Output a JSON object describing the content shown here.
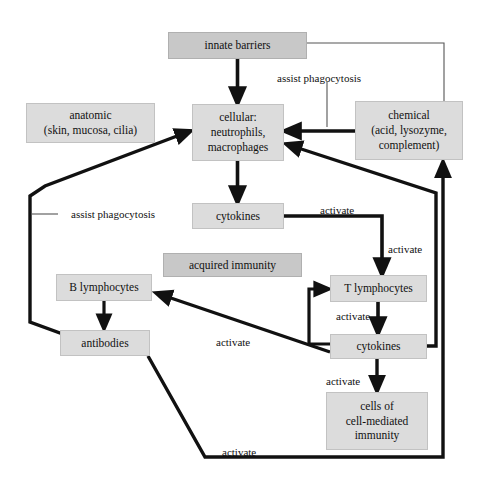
{
  "diagram": {
    "canvas": {
      "width": 478,
      "height": 488
    },
    "colors": {
      "node_fill": "#dcdcdc",
      "node_fill_dark": "#c8c8c8",
      "node_border": "#c2c2c2",
      "edge_stroke": "#111111",
      "background": "#ffffff"
    },
    "nodes": [
      {
        "id": "innate-barriers",
        "label": "innate barriers",
        "x": 168,
        "y": 32,
        "w": 139,
        "h": 27,
        "shade": "dark"
      },
      {
        "id": "anatomic",
        "label": "anatomic\n(skin, mucosa, cilia)",
        "x": 26,
        "y": 103,
        "w": 129,
        "h": 40,
        "shade": "light"
      },
      {
        "id": "cellular",
        "label": "cellular:\nneutrophils,\nmacrophages",
        "x": 192,
        "y": 104,
        "w": 92,
        "h": 57,
        "shade": "light"
      },
      {
        "id": "chemical",
        "label": "chemical\n(acid, lysozyme,\ncomplement)",
        "x": 355,
        "y": 101,
        "w": 108,
        "h": 59,
        "shade": "light"
      },
      {
        "id": "cytokines-innate",
        "label": "cytokines",
        "x": 192,
        "y": 203,
        "w": 92,
        "h": 26,
        "shade": "light"
      },
      {
        "id": "acquired-immunity",
        "label": "acquired immunity",
        "x": 163,
        "y": 253,
        "w": 139,
        "h": 24,
        "shade": "dark"
      },
      {
        "id": "b-lymphocytes",
        "label": "B lymphocytes",
        "x": 56,
        "y": 274,
        "w": 96,
        "h": 27,
        "shade": "light"
      },
      {
        "id": "t-lymphocytes",
        "label": "T lymphocytes",
        "x": 330,
        "y": 275,
        "w": 97,
        "h": 27,
        "shade": "light"
      },
      {
        "id": "antibodies",
        "label": "antibodies",
        "x": 60,
        "y": 330,
        "w": 90,
        "h": 26,
        "shade": "light"
      },
      {
        "id": "cytokines-acquired",
        "label": "cytokines",
        "x": 330,
        "y": 334,
        "w": 97,
        "h": 25,
        "shade": "light"
      },
      {
        "id": "cell-mediated",
        "label": "cells of\ncell-mediated\nimmunity",
        "x": 326,
        "y": 392,
        "w": 102,
        "h": 58,
        "shade": "light"
      }
    ],
    "edge_labels": [
      {
        "id": "assist-phagocytosis-top",
        "text": "assist phagocytosis",
        "x": 277,
        "y": 72
      },
      {
        "id": "assist-phagocytosis-left",
        "text": "assist phagocytosis",
        "x": 71,
        "y": 208
      },
      {
        "id": "activate-cytokines-to-t",
        "text": "activate",
        "x": 320,
        "y": 204
      },
      {
        "id": "activate-down-to-t",
        "text": "activate",
        "x": 388,
        "y": 243
      },
      {
        "id": "activate-t-feedback",
        "text": "activate",
        "x": 336,
        "y": 310
      },
      {
        "id": "activate-to-b",
        "text": "activate",
        "x": 216,
        "y": 336
      },
      {
        "id": "activate-to-cell-mediated",
        "text": "activate",
        "x": 326,
        "y": 375
      },
      {
        "id": "activate-antibodies",
        "text": "activate",
        "x": 222,
        "y": 446
      }
    ],
    "edges": [
      {
        "id": "innate-to-cellular",
        "from": "innate-barriers",
        "to": "cellular",
        "style": "thick-arrow"
      },
      {
        "id": "innate-to-chemical",
        "from": "innate-barriers",
        "to": "chemical",
        "style": "thin-line"
      },
      {
        "id": "chemical-to-cellular",
        "from": "chemical",
        "to": "cellular",
        "style": "thick-arrow",
        "label": "assist phagocytosis"
      },
      {
        "id": "cellular-to-cytokines",
        "from": "cellular",
        "to": "cytokines-innate",
        "style": "thick-arrow"
      },
      {
        "id": "cytokines-to-t",
        "from": "cytokines-innate",
        "to": "t-lymphocytes",
        "style": "thick-arrow",
        "label": "activate"
      },
      {
        "id": "t-to-cytokines",
        "from": "t-lymphocytes",
        "to": "cytokines-acquired",
        "style": "thick-arrow"
      },
      {
        "id": "cytokines-acq-to-t",
        "from": "cytokines-acquired",
        "to": "t-lymphocytes",
        "style": "thick-arrow",
        "label": "activate"
      },
      {
        "id": "cytokines-acq-to-b",
        "from": "cytokines-acquired",
        "to": "b-lymphocytes",
        "style": "thick-arrow",
        "label": "activate"
      },
      {
        "id": "cytokines-acq-to-cell-mediated",
        "from": "cytokines-acquired",
        "to": "cell-mediated",
        "style": "thick-arrow",
        "label": "activate"
      },
      {
        "id": "cytokines-acq-to-cellular",
        "from": "cytokines-acquired",
        "to": "cellular",
        "style": "thick-arrow"
      },
      {
        "id": "b-to-antibodies",
        "from": "b-lymphocytes",
        "to": "antibodies",
        "style": "thick-arrow"
      },
      {
        "id": "antibodies-to-chemical",
        "from": "antibodies",
        "to": "chemical",
        "style": "thick-arrow",
        "label": "activate"
      },
      {
        "id": "antibodies-loop-to-cellular",
        "from": "antibodies",
        "to": "cellular",
        "style": "thick-arrow",
        "label": "assist phagocytosis"
      }
    ]
  }
}
